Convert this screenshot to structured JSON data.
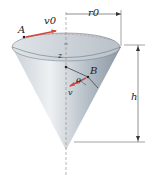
{
  "figure": {
    "type": "inverted-cone",
    "labels": {
      "point_a": "A",
      "v0": "v0",
      "r0": "r0",
      "z": "z",
      "point_b": "B",
      "v": "v",
      "theta": "θ",
      "h": "h"
    },
    "colors": {
      "cone_light": "#e8ecef",
      "cone_dark": "#8a96a3",
      "velocity_arrow": "#d04a3a",
      "line": "#333333"
    }
  }
}
